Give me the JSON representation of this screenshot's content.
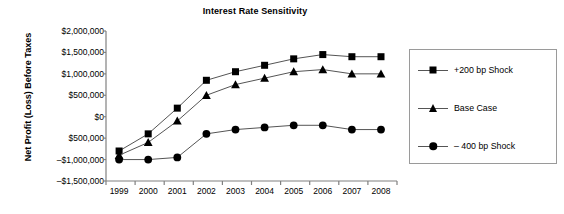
{
  "chart_data": {
    "type": "line",
    "title": "Interest Rate Sensitivity",
    "xlabel": "",
    "ylabel": "Net Profit (Loss) Before Taxes",
    "categories": [
      "1999",
      "2000",
      "2001",
      "2002",
      "2003",
      "2004",
      "2005",
      "2006",
      "2007",
      "2008"
    ],
    "ylim": [
      -1500000,
      2000000
    ],
    "ytick_values": [
      2000000,
      1500000,
      1000000,
      500000,
      0,
      -500000,
      -1000000,
      -1500000
    ],
    "ytick_labels": [
      "$2,000,000",
      "$1,500,000",
      "$1,000,000",
      "$500,000",
      "$0",
      "$500,000",
      "–$1,000,000",
      "–$1,500,000"
    ],
    "grid": false,
    "legend_position": "right",
    "series": [
      {
        "name": "+200 bp Shock",
        "marker": "square",
        "values": [
          -800000,
          -400000,
          200000,
          850000,
          1050000,
          1200000,
          1350000,
          1450000,
          1400000,
          1400000
        ]
      },
      {
        "name": "Base Case",
        "marker": "triangle",
        "values": [
          -900000,
          -600000,
          -100000,
          500000,
          750000,
          900000,
          1050000,
          1100000,
          1000000,
          1000000
        ]
      },
      {
        "name": "– 400 bp Shock",
        "marker": "circle",
        "values": [
          -1000000,
          -1000000,
          -950000,
          -400000,
          -300000,
          -250000,
          -200000,
          -200000,
          -300000,
          -300000
        ]
      }
    ]
  },
  "legend": {
    "items": [
      {
        "label": "+200 bp Shock",
        "marker": "square"
      },
      {
        "label": "Base Case",
        "marker": "triangle"
      },
      {
        "label": "– 400 bp Shock",
        "marker": "circle"
      }
    ]
  },
  "colors": {
    "series": "#000000",
    "axis": "#808080",
    "legend_border": "#9a9a9a",
    "background": "#ffffff"
  }
}
